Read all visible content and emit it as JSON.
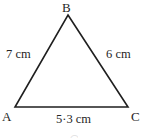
{
  "figure": {
    "background_color": "#ffffff",
    "stroke_color": "#1f1f1f",
    "text_color": "#262626",
    "stroke_width": 1.6
  },
  "vertices": {
    "b": {
      "label": "B",
      "x": 68,
      "y": 15
    },
    "a": {
      "label": "A",
      "x": 15,
      "y": 107
    },
    "c": {
      "label": "C",
      "x": 128,
      "y": 107
    }
  },
  "sides": {
    "ab": {
      "label": "7 cm",
      "value": 7,
      "unit": "cm"
    },
    "bc": {
      "label": "6 cm",
      "value": 6,
      "unit": "cm"
    },
    "ac": {
      "label": "5·3 cm",
      "value": 5.3,
      "unit": "cm"
    }
  },
  "artifact": {
    "bottom_mark": "◠"
  }
}
